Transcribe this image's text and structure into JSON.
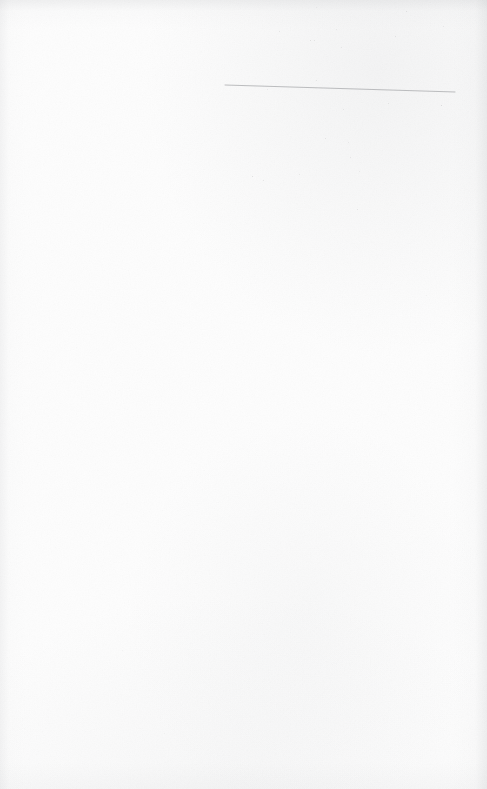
{
  "document": {
    "kind": "scanned-page",
    "description": "Blank scanned book page with a single faint hand-drawn horizontal rule near the top",
    "page_width": 487,
    "page_height": 789,
    "text_content": "",
    "has_text": false,
    "paper_color": "#fdfdfd",
    "edge_shadow_color": "#a8aaae"
  },
  "marks": {
    "rule_line": {
      "label": "horizontal rule",
      "x1": 225,
      "y1": 85,
      "x2": 455,
      "y2": 92,
      "thickness": 1,
      "color": "#b0b2b4",
      "opacity": 0.85
    }
  },
  "artifacts": {
    "speckle_color": "#b9bbbf",
    "dense_region": {
      "label": "foxing / scanner noise cluster",
      "x": 252,
      "y": 0,
      "width": 235,
      "height": 215
    },
    "sparse_region": {
      "label": "scattered page specks",
      "x": 0,
      "y": 0,
      "width": 487,
      "height": 789
    },
    "lower_region": {
      "label": "lower scattered specks",
      "x": 236,
      "y": 470,
      "width": 251,
      "height": 300
    }
  }
}
